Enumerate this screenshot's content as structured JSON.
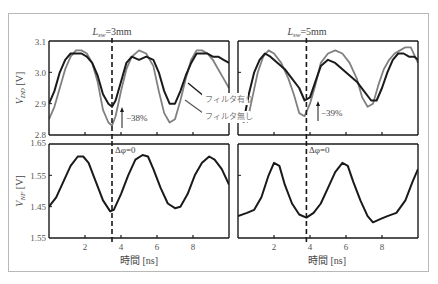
{
  "chart_data": [
    {
      "type": "line",
      "panel": "top-left",
      "title": "L_sw=3mm",
      "title_main": "L",
      "title_sub": "sw",
      "title_rest": "=3mm",
      "xlabel": "",
      "ylabel": "V_DD [V]",
      "xlim": [
        0,
        10
      ],
      "ylim": [
        2.8,
        3.1
      ],
      "yticks": [
        "2.8",
        "2.9",
        "3.0",
        "3.1"
      ],
      "xticks": [
        2,
        4,
        6,
        8
      ],
      "vline_x": 3.5,
      "annotation": "−38%",
      "series": [
        {
          "name": "フィルタ有り",
          "color": "#1a1a1a",
          "x": [
            0,
            0.3,
            0.6,
            0.9,
            1.2,
            1.5,
            1.8,
            2.1,
            2.4,
            2.7,
            3.0,
            3.3,
            3.5,
            3.7,
            4.0,
            4.3,
            4.6,
            5.0,
            5.4,
            5.8,
            6.1,
            6.4,
            6.7,
            7.0,
            7.3,
            7.6,
            7.9,
            8.2,
            8.5,
            8.8,
            9.1,
            9.4,
            9.7,
            10.0
          ],
          "y": [
            2.9,
            2.94,
            3.0,
            3.04,
            3.06,
            3.06,
            3.06,
            3.05,
            3.03,
            2.99,
            2.93,
            2.9,
            2.89,
            2.91,
            2.97,
            3.03,
            3.05,
            3.04,
            3.05,
            3.04,
            3.0,
            2.94,
            2.9,
            2.9,
            2.94,
            2.99,
            3.03,
            3.06,
            3.06,
            3.06,
            3.05,
            3.05,
            3.04,
            3.03
          ]
        },
        {
          "name": "フィルタ無し",
          "color": "#808080",
          "x": [
            0,
            0.3,
            0.6,
            0.9,
            1.2,
            1.5,
            1.8,
            2.1,
            2.4,
            2.7,
            3.0,
            3.3,
            3.5,
            3.7,
            4.0,
            4.3,
            4.6,
            5.0,
            5.4,
            5.8,
            6.1,
            6.4,
            6.7,
            7.0,
            7.3,
            7.6,
            7.9,
            8.2,
            8.5,
            8.8,
            9.1,
            9.4,
            9.7,
            10.0
          ],
          "y": [
            2.85,
            2.89,
            2.95,
            3.01,
            3.05,
            3.07,
            3.07,
            3.06,
            3.03,
            2.97,
            2.88,
            2.84,
            2.83,
            2.86,
            2.94,
            3.01,
            3.05,
            3.07,
            3.06,
            3.02,
            2.94,
            2.87,
            2.84,
            2.85,
            2.91,
            2.98,
            3.04,
            3.07,
            3.07,
            3.06,
            3.04,
            3.01,
            2.98,
            2.95
          ]
        }
      ]
    },
    {
      "type": "line",
      "panel": "top-right",
      "title": "L_sw=5mm",
      "title_main": "L",
      "title_sub": "sw",
      "title_rest": "=5mm",
      "xlabel": "",
      "ylabel": "",
      "xlim": [
        0,
        10
      ],
      "ylim": [
        2.8,
        3.1
      ],
      "xticks": [
        2,
        4,
        6,
        8
      ],
      "vline_x": 3.8,
      "annotation": "−39%",
      "series": [
        {
          "name": "フィルタ有り",
          "color": "#1a1a1a",
          "x": [
            0.3,
            0.6,
            0.9,
            1.2,
            1.5,
            1.8,
            2.2,
            2.6,
            3.0,
            3.4,
            3.7,
            4.0,
            4.3,
            4.6,
            5.0,
            5.4,
            5.8,
            6.2,
            6.6,
            7.0,
            7.4,
            7.7,
            8.0,
            8.3,
            8.6,
            8.9,
            9.2,
            9.5,
            9.8,
            10.0
          ],
          "y": [
            2.84,
            2.93,
            3.0,
            3.04,
            3.06,
            3.05,
            3.03,
            3.01,
            2.98,
            2.95,
            2.91,
            2.92,
            2.97,
            3.02,
            3.04,
            3.03,
            3.01,
            2.99,
            2.97,
            2.94,
            2.91,
            2.91,
            2.95,
            3.0,
            3.04,
            3.06,
            3.06,
            3.05,
            3.05,
            3.04
          ]
        },
        {
          "name": "フィルタ無し",
          "color": "#808080",
          "x": [
            0.5,
            0.8,
            1.1,
            1.4,
            1.7,
            2.0,
            2.4,
            2.8,
            3.1,
            3.4,
            3.7,
            4.0,
            4.3,
            4.6,
            5.0,
            5.4,
            5.8,
            6.2,
            6.6,
            6.9,
            7.2,
            7.5,
            7.8,
            8.1,
            8.4,
            8.7,
            9.0,
            9.3,
            9.6,
            10.0
          ],
          "y": [
            2.84,
            2.92,
            3.0,
            3.05,
            3.07,
            3.06,
            3.03,
            2.98,
            2.93,
            2.87,
            2.86,
            2.9,
            2.96,
            3.03,
            3.06,
            3.07,
            3.06,
            3.03,
            2.98,
            2.92,
            2.89,
            2.9,
            2.96,
            3.01,
            3.04,
            3.06,
            3.07,
            3.08,
            3.08,
            3.03
          ]
        }
      ]
    },
    {
      "type": "line",
      "panel": "bottom-left",
      "xlabel": "時間 [ns]",
      "ylabel": "V_NF [V]",
      "xlim": [
        0,
        10
      ],
      "ylim": [
        1.35,
        1.65
      ],
      "yticks": [
        "1.55",
        "1.45",
        "1.55",
        "1.65"
      ],
      "xticks": [
        2,
        4,
        6,
        8
      ],
      "vline_x": 3.5,
      "annotation": "Δφ=0",
      "series": [
        {
          "name": "V_NF",
          "color": "#1a1a1a",
          "x": [
            0,
            0.4,
            0.8,
            1.2,
            1.6,
            1.9,
            2.2,
            2.6,
            3.0,
            3.4,
            3.6,
            4.0,
            4.4,
            4.8,
            5.2,
            5.5,
            5.8,
            6.2,
            6.6,
            7.0,
            7.3,
            7.7,
            8.1,
            8.5,
            8.9,
            9.2,
            9.6,
            10.0
          ],
          "y": [
            1.45,
            1.48,
            1.53,
            1.58,
            1.61,
            1.61,
            1.59,
            1.53,
            1.47,
            1.435,
            1.44,
            1.49,
            1.55,
            1.6,
            1.615,
            1.61,
            1.57,
            1.51,
            1.46,
            1.445,
            1.45,
            1.49,
            1.55,
            1.59,
            1.61,
            1.6,
            1.57,
            1.52
          ]
        }
      ]
    },
    {
      "type": "line",
      "panel": "bottom-right",
      "xlabel": "時間 [ns]",
      "ylabel": "",
      "xlim": [
        0,
        10
      ],
      "ylim": [
        1.35,
        1.65
      ],
      "xticks": [
        2,
        4,
        6,
        8
      ],
      "vline_x": 3.8,
      "annotation": "Δφ=0",
      "series": [
        {
          "name": "V_NF",
          "color": "#1a1a1a",
          "x": [
            0,
            0.5,
            0.9,
            1.3,
            1.7,
            2.0,
            2.3,
            2.6,
            3.0,
            3.4,
            3.8,
            4.2,
            4.6,
            5.0,
            5.4,
            5.8,
            6.1,
            6.4,
            6.8,
            7.2,
            7.5,
            7.9,
            8.3,
            8.8,
            9.3,
            9.7,
            10.0
          ],
          "y": [
            1.42,
            1.43,
            1.44,
            1.48,
            1.55,
            1.59,
            1.58,
            1.52,
            1.46,
            1.425,
            1.415,
            1.43,
            1.46,
            1.51,
            1.56,
            1.59,
            1.58,
            1.53,
            1.47,
            1.42,
            1.4,
            1.41,
            1.42,
            1.43,
            1.47,
            1.53,
            1.57
          ]
        }
      ]
    }
  ],
  "labels": {
    "top_left_title_main": "L",
    "top_left_title_sub": "sw",
    "top_left_title_rest": "=3mm",
    "top_right_title_main": "L",
    "top_right_title_sub": "sw",
    "top_right_title_rest": "=5mm",
    "ylabel_top_main": "V",
    "ylabel_top_sub": "DD",
    "ylabel_top_unit": " [V]",
    "ylabel_bottom_main": "V",
    "ylabel_bottom_sub": "NF",
    "ylabel_bottom_unit": " [V]",
    "yticks_top": [
      "3.1",
      "3.0",
      "2.9",
      "2.8"
    ],
    "yticks_bottom": [
      "1.65",
      "1.55",
      "1.45",
      "1.55"
    ],
    "xticks": [
      "2",
      "4",
      "6",
      "8"
    ],
    "xlabel_left": "時間 [ns]",
    "xlabel_right": "時間 [ns]",
    "legend_with_filter": "フィルタ有り",
    "legend_without_filter": "フィルタ無し",
    "annot_left_pct": "−38%",
    "annot_right_pct": "−39%",
    "annot_left_phase": "Δφ=0",
    "annot_right_phase": "Δφ=0"
  },
  "colors": {
    "with_filter": "#1a1a1a",
    "without_filter": "#808080",
    "axis": "#1a1a1a",
    "frame": "#b8b8b8"
  }
}
